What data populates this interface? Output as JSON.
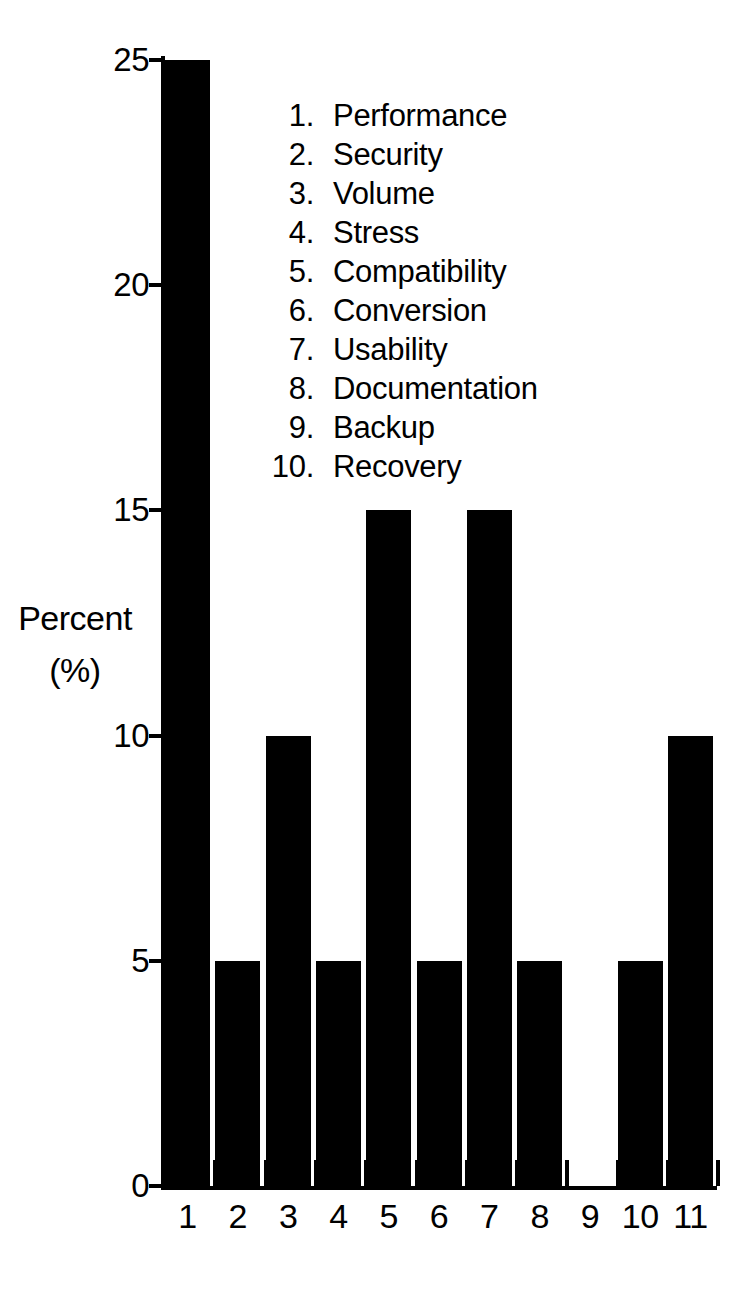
{
  "chart_data": {
    "type": "bar",
    "title": "",
    "xlabel": "",
    "ylabel": "Percent (%)",
    "categories": [
      "1",
      "2",
      "3",
      "4",
      "5",
      "6",
      "7",
      "8",
      "9",
      "10",
      "11"
    ],
    "values": [
      25,
      5,
      10,
      5,
      15,
      5,
      15,
      5,
      0,
      5,
      10
    ],
    "ylim": [
      0,
      25
    ],
    "yticks": [
      0,
      5,
      10,
      15,
      20,
      25
    ],
    "ytick_labels": [
      "0",
      "5",
      "10",
      "15",
      "20",
      "25"
    ],
    "xtick_labels": [
      "1",
      "2",
      "3",
      "4",
      "5",
      "6",
      "7",
      "8",
      "9",
      "10",
      "11"
    ],
    "grid": false,
    "legend_position": "inside-top-center",
    "bar_color": "#000000",
    "background_color": "#ffffff",
    "axis_color": "#000000"
  },
  "axis": {
    "y_title_line1": "Percent",
    "y_title_line2": "(%)"
  },
  "legend": {
    "items": [
      {
        "num": "1.",
        "label": "Performance"
      },
      {
        "num": "2.",
        "label": "Security"
      },
      {
        "num": "3.",
        "label": "Volume"
      },
      {
        "num": "4.",
        "label": "Stress"
      },
      {
        "num": "5.",
        "label": "Compatibility"
      },
      {
        "num": "6.",
        "label": "Conversion"
      },
      {
        "num": "7.",
        "label": "Usability"
      },
      {
        "num": "8.",
        "label": "Documentation"
      },
      {
        "num": "9.",
        "label": "Backup"
      },
      {
        "num": "10.",
        "label": "Recovery"
      }
    ]
  }
}
